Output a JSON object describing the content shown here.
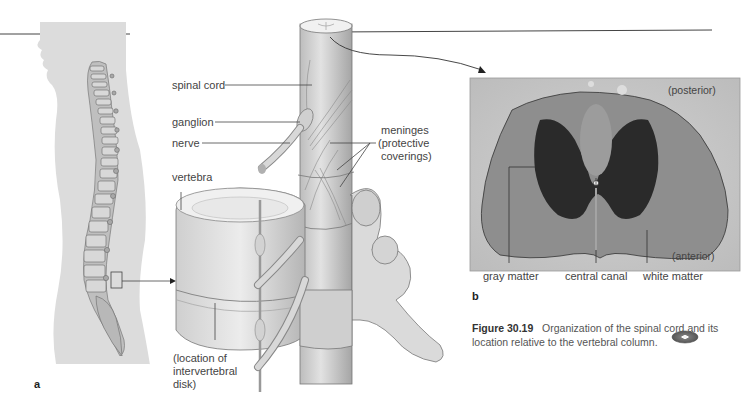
{
  "figure": {
    "number": "Figure 30.19",
    "caption": "Organization of the spinal cord and its location relative to the vertebral column.",
    "media_icon": "cd-disc-icon"
  },
  "panel_a": {
    "letter": "a",
    "labels": {
      "spinal_cord": "spinal cord",
      "ganglion": "ganglion",
      "nerve": "nerve",
      "vertebra": "vertebra",
      "meninges": "meninges",
      "meninges_note_1": "(protective",
      "meninges_note_2": "coverings)",
      "disk_1": "(location of",
      "disk_2": "intervertebral",
      "disk_3": "disk)"
    }
  },
  "panel_b": {
    "letter": "b",
    "labels": {
      "posterior": "(posterior)",
      "anterior": "(anterior)",
      "gray_matter": "gray matter",
      "central_canal": "central canal",
      "white_matter": "white matter"
    }
  },
  "colors": {
    "silhouette": "#dcdcdc",
    "bone": "#e6e6e6",
    "bone_shade": "#a9a9a9",
    "photo_bg": "#c8c8c8",
    "gray_matter": "#2a2a2a",
    "white_matter": "#8c8c8c",
    "line": "#444444"
  }
}
